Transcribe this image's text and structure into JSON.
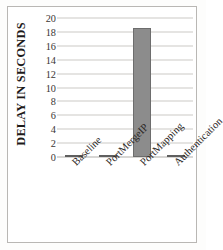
{
  "chart_data": {
    "type": "bar",
    "title": "",
    "xlabel": "",
    "ylabel": "DELAY IN SECONDS",
    "categories": [
      "Baseline",
      "PortMergeIP",
      "PortMapping",
      "Authentication"
    ],
    "values": [
      0.1,
      0.1,
      18.5,
      0.15
    ],
    "ylim": [
      0,
      20
    ],
    "ytick_step": 2,
    "yticks": [
      20,
      18,
      16,
      14,
      12,
      10,
      8,
      6,
      4,
      2,
      0
    ],
    "grid": true,
    "legend": false,
    "series": [
      {
        "name": "Delay",
        "values": [
          0.1,
          0.1,
          18.5,
          0.15
        ]
      }
    ],
    "colors": {
      "bar_fill": "#8c8c8c",
      "bar_stroke": "#6d6d6d",
      "gridline": "#ccc9c6",
      "axis_text": "#3a3634",
      "title_text": "#1d1a19",
      "frame": "#b9b7b4",
      "background": "#ffffff"
    }
  }
}
